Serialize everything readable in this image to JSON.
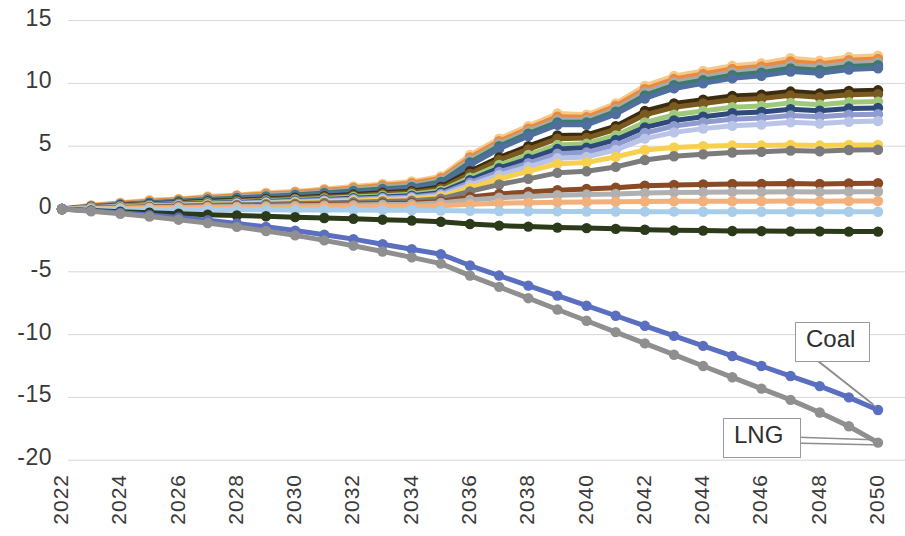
{
  "chart_data": {
    "type": "line",
    "title": "",
    "subtitle": "",
    "xlabel": "",
    "ylabel": "",
    "grid": true,
    "legend_position": "none",
    "xlim": [
      2022,
      2050
    ],
    "ylim": [
      -20,
      15
    ],
    "yticks": [
      15,
      10,
      5,
      0,
      -5,
      -10,
      -15,
      -20
    ],
    "ytick_labels": [
      "15",
      "10",
      "5",
      "0",
      "-5",
      "-10",
      "-15",
      "-20"
    ],
    "xticks": [
      2022,
      2024,
      2026,
      2028,
      2030,
      2032,
      2034,
      2036,
      2038,
      2040,
      2042,
      2044,
      2046,
      2048,
      2050
    ],
    "xtick_labels": [
      "2022",
      "2024",
      "2026",
      "2028",
      "2030",
      "2032",
      "2034",
      "2036",
      "2038",
      "2040",
      "2042",
      "2044",
      "2046",
      "2048",
      "2050"
    ],
    "x": [
      2022,
      2023,
      2024,
      2025,
      2026,
      2027,
      2028,
      2029,
      2030,
      2031,
      2032,
      2033,
      2034,
      2035,
      2036,
      2037,
      2038,
      2039,
      2040,
      2041,
      2042,
      2043,
      2044,
      2045,
      2046,
      2047,
      2048,
      2049,
      2050
    ],
    "annotations": [
      {
        "label": "Coal",
        "series": "Coal",
        "points_to_x": 2050,
        "points_to_y": -16.0
      },
      {
        "label": "LNG",
        "series": "LNG",
        "points_to_x": 2050,
        "points_to_y": -18.6
      }
    ],
    "series": [
      {
        "name": "s1",
        "color": "#f5c98a",
        "values": [
          0,
          0.3,
          0.5,
          0.7,
          0.8,
          1.0,
          1.1,
          1.3,
          1.4,
          1.6,
          1.8,
          2.0,
          2.2,
          2.6,
          4.3,
          5.6,
          6.6,
          7.6,
          7.5,
          8.4,
          9.8,
          10.6,
          11.0,
          11.4,
          11.6,
          12.0,
          11.8,
          12.1,
          12.2
        ]
      },
      {
        "name": "s2",
        "color": "#ec8a3c",
        "values": [
          0,
          0.25,
          0.45,
          0.62,
          0.75,
          0.92,
          1.05,
          1.2,
          1.32,
          1.5,
          1.68,
          1.88,
          2.05,
          2.45,
          4.1,
          5.4,
          6.4,
          7.35,
          7.3,
          8.2,
          9.55,
          10.35,
          10.75,
          11.15,
          11.35,
          11.75,
          11.55,
          11.85,
          11.95
        ]
      },
      {
        "name": "s3",
        "color": "#a9a9a9",
        "values": [
          0,
          0.22,
          0.4,
          0.56,
          0.68,
          0.84,
          0.96,
          1.1,
          1.22,
          1.38,
          1.55,
          1.74,
          1.9,
          2.3,
          3.9,
          5.2,
          6.2,
          7.1,
          7.1,
          7.95,
          9.3,
          10.1,
          10.5,
          10.9,
          11.1,
          11.45,
          11.3,
          11.6,
          11.7
        ]
      },
      {
        "name": "s4",
        "color": "#3e7a6a",
        "values": [
          0,
          0.2,
          0.36,
          0.5,
          0.62,
          0.76,
          0.88,
          1.0,
          1.12,
          1.27,
          1.43,
          1.6,
          1.76,
          2.15,
          3.7,
          5.0,
          6.0,
          6.9,
          6.9,
          7.75,
          9.05,
          9.85,
          10.25,
          10.65,
          10.85,
          11.2,
          11.05,
          11.35,
          11.45
        ]
      },
      {
        "name": "s5",
        "color": "#4f6f9e",
        "values": [
          0,
          0.18,
          0.33,
          0.46,
          0.57,
          0.7,
          0.8,
          0.92,
          1.03,
          1.17,
          1.32,
          1.48,
          1.63,
          2.0,
          3.5,
          4.8,
          5.8,
          6.7,
          6.7,
          7.55,
          8.8,
          9.6,
          10.0,
          10.4,
          10.6,
          10.95,
          10.8,
          11.1,
          11.2
        ]
      },
      {
        "name": "s6",
        "color": "#3b2b10",
        "values": [
          0,
          0.15,
          0.28,
          0.4,
          0.5,
          0.61,
          0.7,
          0.8,
          0.9,
          1.02,
          1.15,
          1.29,
          1.42,
          1.75,
          3.0,
          4.1,
          5.0,
          5.85,
          5.9,
          6.6,
          7.8,
          8.4,
          8.7,
          9.0,
          9.1,
          9.35,
          9.2,
          9.4,
          9.45
        ]
      },
      {
        "name": "s7",
        "color": "#7a5a1e",
        "values": [
          0,
          0.14,
          0.26,
          0.37,
          0.46,
          0.56,
          0.64,
          0.74,
          0.83,
          0.94,
          1.06,
          1.19,
          1.31,
          1.62,
          2.8,
          3.9,
          4.75,
          5.6,
          5.65,
          6.35,
          7.5,
          8.1,
          8.4,
          8.7,
          8.8,
          9.05,
          8.9,
          9.1,
          9.15
        ]
      },
      {
        "name": "s8",
        "color": "#9ec97a",
        "values": [
          0,
          0.12,
          0.23,
          0.33,
          0.41,
          0.5,
          0.57,
          0.66,
          0.74,
          0.84,
          0.95,
          1.06,
          1.17,
          1.45,
          2.5,
          3.5,
          4.3,
          5.1,
          5.2,
          5.85,
          6.9,
          7.5,
          7.8,
          8.1,
          8.2,
          8.45,
          8.3,
          8.5,
          8.55
        ]
      },
      {
        "name": "s9",
        "color": "#2e4a7a",
        "values": [
          0,
          0.11,
          0.21,
          0.3,
          0.37,
          0.45,
          0.52,
          0.6,
          0.67,
          0.76,
          0.86,
          0.96,
          1.06,
          1.32,
          2.3,
          3.25,
          4.0,
          4.78,
          4.88,
          5.5,
          6.5,
          7.05,
          7.35,
          7.62,
          7.72,
          7.95,
          7.82,
          8.0,
          8.05
        ]
      },
      {
        "name": "s10",
        "color": "#8f9bcf",
        "values": [
          0,
          0.1,
          0.19,
          0.27,
          0.34,
          0.41,
          0.47,
          0.54,
          0.61,
          0.69,
          0.78,
          0.87,
          0.96,
          1.2,
          2.1,
          2.95,
          3.65,
          4.4,
          4.5,
          5.1,
          6.05,
          6.6,
          6.9,
          7.15,
          7.25,
          7.45,
          7.35,
          7.5,
          7.55
        ]
      },
      {
        "name": "s11",
        "color": "#b9c4e8",
        "values": [
          0,
          0.09,
          0.17,
          0.24,
          0.3,
          0.37,
          0.42,
          0.49,
          0.55,
          0.62,
          0.7,
          0.78,
          0.86,
          1.08,
          1.9,
          2.7,
          3.35,
          4.05,
          4.15,
          4.7,
          5.6,
          6.1,
          6.4,
          6.62,
          6.72,
          6.9,
          6.8,
          6.95,
          7.0
        ]
      },
      {
        "name": "s12",
        "color": "#f7d14e",
        "values": [
          0,
          0.08,
          0.15,
          0.22,
          0.27,
          0.33,
          0.38,
          0.44,
          0.49,
          0.56,
          0.63,
          0.7,
          0.77,
          0.97,
          1.7,
          2.4,
          3.0,
          3.6,
          3.7,
          4.15,
          4.7,
          4.9,
          5.0,
          5.05,
          5.05,
          5.1,
          5.05,
          5.1,
          5.1
        ]
      },
      {
        "name": "s13",
        "color": "#7b7b7b",
        "values": [
          0,
          0.07,
          0.13,
          0.19,
          0.24,
          0.29,
          0.33,
          0.38,
          0.43,
          0.48,
          0.54,
          0.6,
          0.66,
          0.82,
          1.4,
          1.95,
          2.4,
          2.88,
          3.0,
          3.35,
          3.9,
          4.2,
          4.35,
          4.5,
          4.55,
          4.65,
          4.6,
          4.7,
          4.72
        ]
      },
      {
        "name": "s14",
        "color": "#8a4a24",
        "values": [
          0,
          0.05,
          0.1,
          0.14,
          0.18,
          0.21,
          0.24,
          0.28,
          0.31,
          0.35,
          0.39,
          0.44,
          0.48,
          0.6,
          0.95,
          1.2,
          1.35,
          1.5,
          1.6,
          1.7,
          1.85,
          1.92,
          1.96,
          2.0,
          2.0,
          2.03,
          2.0,
          2.03,
          2.05
        ]
      },
      {
        "name": "s15",
        "color": "#b0b0b0",
        "values": [
          0,
          0.04,
          0.08,
          0.11,
          0.14,
          0.17,
          0.19,
          0.22,
          0.25,
          0.28,
          0.31,
          0.35,
          0.38,
          0.48,
          0.72,
          0.9,
          1.0,
          1.1,
          1.15,
          1.2,
          1.28,
          1.32,
          1.34,
          1.36,
          1.36,
          1.38,
          1.36,
          1.38,
          1.38
        ]
      },
      {
        "name": "s16",
        "color": "#f3b07a",
        "values": [
          0,
          0.02,
          0.04,
          0.06,
          0.08,
          0.09,
          0.1,
          0.12,
          0.13,
          0.15,
          0.17,
          0.19,
          0.21,
          0.26,
          0.38,
          0.46,
          0.5,
          0.54,
          0.56,
          0.58,
          0.6,
          0.61,
          0.62,
          0.62,
          0.62,
          0.63,
          0.62,
          0.63,
          0.63
        ]
      },
      {
        "name": "s17",
        "color": "#a8cdea",
        "values": [
          0,
          -0.01,
          -0.02,
          -0.03,
          -0.04,
          -0.05,
          -0.05,
          -0.06,
          -0.07,
          -0.08,
          -0.08,
          -0.09,
          -0.1,
          -0.12,
          -0.15,
          -0.17,
          -0.18,
          -0.19,
          -0.2,
          -0.2,
          -0.21,
          -0.21,
          -0.22,
          -0.22,
          -0.22,
          -0.22,
          -0.22,
          -0.22,
          -0.22
        ]
      },
      {
        "name": "s18",
        "color": "#2b3a18",
        "values": [
          0,
          -0.12,
          -0.22,
          -0.3,
          -0.38,
          -0.45,
          -0.52,
          -0.58,
          -0.65,
          -0.72,
          -0.78,
          -0.85,
          -0.92,
          -1.02,
          -1.2,
          -1.32,
          -1.4,
          -1.48,
          -1.52,
          -1.58,
          -1.65,
          -1.7,
          -1.72,
          -1.75,
          -1.76,
          -1.78,
          -1.78,
          -1.8,
          -1.8
        ]
      },
      {
        "name": "Coal",
        "color": "#5a6fc0",
        "values": [
          0,
          -0.15,
          -0.3,
          -0.48,
          -0.68,
          -0.9,
          -1.15,
          -1.42,
          -1.72,
          -2.05,
          -2.4,
          -2.8,
          -3.2,
          -3.6,
          -4.5,
          -5.3,
          -6.1,
          -6.9,
          -7.7,
          -8.5,
          -9.3,
          -10.1,
          -10.9,
          -11.7,
          -12.5,
          -13.3,
          -14.1,
          -15.0,
          -16.0
        ]
      },
      {
        "name": "LNG",
        "color": "#8f8f8f",
        "values": [
          0,
          -0.18,
          -0.38,
          -0.6,
          -0.85,
          -1.12,
          -1.42,
          -1.75,
          -2.1,
          -2.5,
          -2.92,
          -3.38,
          -3.85,
          -4.35,
          -5.3,
          -6.2,
          -7.1,
          -8.0,
          -8.9,
          -9.8,
          -10.7,
          -11.6,
          -12.5,
          -13.4,
          -14.3,
          -15.2,
          -16.2,
          -17.3,
          -18.6
        ]
      }
    ]
  }
}
